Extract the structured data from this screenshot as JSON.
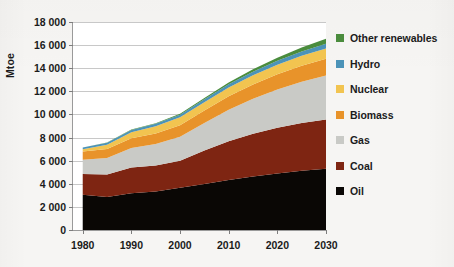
{
  "chart_data": {
    "type": "area",
    "stacked": true,
    "title": "",
    "xlabel": "",
    "ylabel": "Mtoe",
    "x": [
      1980,
      1985,
      1990,
      1995,
      2000,
      2005,
      2010,
      2015,
      2020,
      2025,
      2030
    ],
    "xlim": [
      1978,
      2030
    ],
    "ylim": [
      0,
      18000
    ],
    "ytick_labels": [
      "0",
      "2 000",
      "4 000",
      "6 000",
      "8 000",
      "10 000",
      "12 000",
      "14 000",
      "16 000",
      "18 000"
    ],
    "ytick_values": [
      0,
      2000,
      4000,
      6000,
      8000,
      10000,
      12000,
      14000,
      16000,
      18000
    ],
    "xtick_labels": [
      "1980",
      "1990",
      "2000",
      "2010",
      "2020",
      "2030"
    ],
    "xtick_values": [
      1980,
      1990,
      2000,
      2010,
      2020,
      2030
    ],
    "grid": true,
    "legend_position": "right",
    "series": [
      {
        "name": "Oil",
        "color": "#0a0705",
        "values": [
          3050,
          2860,
          3180,
          3330,
          3650,
          3980,
          4330,
          4630,
          4900,
          5120,
          5300
        ]
      },
      {
        "name": "Coal",
        "color": "#7e2512",
        "values": [
          1800,
          1940,
          2230,
          2260,
          2340,
          2890,
          3360,
          3700,
          3950,
          4130,
          4260
        ]
      },
      {
        "name": "Gas",
        "color": "#c9cac6",
        "values": [
          1240,
          1440,
          1680,
          1850,
          2080,
          2390,
          2720,
          3030,
          3310,
          3570,
          3800
        ]
      },
      {
        "name": "Biomass",
        "color": "#e8932a",
        "values": [
          700,
          760,
          840,
          920,
          1000,
          1080,
          1160,
          1240,
          1320,
          1400,
          1470
        ]
      },
      {
        "name": "Nuclear",
        "color": "#f2c450",
        "values": [
          190,
          380,
          530,
          610,
          680,
          720,
          760,
          790,
          820,
          850,
          880
        ]
      },
      {
        "name": "Hydro",
        "color": "#4c93b8",
        "values": [
          150,
          170,
          190,
          215,
          230,
          255,
          285,
          315,
          345,
          375,
          400
        ]
      },
      {
        "name": "Other renewables",
        "color": "#4a8c3d",
        "values": [
          20,
          28,
          38,
          52,
          70,
          100,
          145,
          200,
          270,
          350,
          430
        ]
      }
    ]
  },
  "legend": {
    "items": [
      {
        "label": "Other renewables",
        "color": "#4a8c3d"
      },
      {
        "label": "Hydro",
        "color": "#4c93b8"
      },
      {
        "label": "Nuclear",
        "color": "#f2c450"
      },
      {
        "label": "Biomass",
        "color": "#e8932a"
      },
      {
        "label": "Gas",
        "color": "#c9cac6"
      },
      {
        "label": "Coal",
        "color": "#7e2512"
      },
      {
        "label": "Oil",
        "color": "#0a0705"
      }
    ]
  }
}
